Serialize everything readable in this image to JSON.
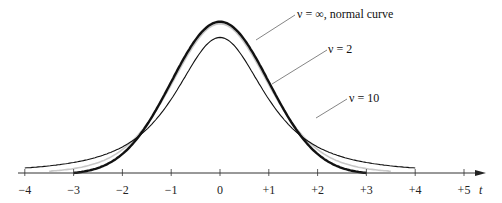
{
  "chart_data": {
    "type": "line",
    "title": "",
    "xlabel": "t",
    "ylabel": "",
    "xlim": [
      -4,
      5
    ],
    "grid": false,
    "legend": "annotations with leader lines",
    "x_ticks": [
      "−4",
      "−3",
      "−2",
      "−1",
      "0",
      "+1",
      "+2",
      "+3",
      "+4",
      "+5"
    ],
    "x_tick_values": [
      -4,
      -3,
      -2,
      -1,
      0,
      1,
      2,
      3,
      4,
      5
    ],
    "series": [
      {
        "name": "ν = ∞, normal curve",
        "distribution": "standard normal",
        "df": "infinity",
        "x_range": [
          -3,
          3
        ],
        "peak": 0.399,
        "color": "#111111",
        "stroke_width": 2.4
      },
      {
        "name": "ν = 10",
        "distribution": "Student t",
        "df": 10,
        "x_range": [
          -3.5,
          3.5
        ],
        "peak": 0.389,
        "color": "#c8c8c8",
        "stroke_width": 1.6
      },
      {
        "name": "ν = 2",
        "distribution": "Student t",
        "df": 2,
        "x_range": [
          -4,
          4
        ],
        "peak": 0.354,
        "color": "#111111",
        "stroke_width": 1.1
      }
    ],
    "annotations": [
      {
        "text": "ν = ∞,  normal curve",
        "target_series": "normal"
      },
      {
        "text": "ν = 2",
        "target_series": "t df=2"
      },
      {
        "text": "ν = 10",
        "target_series": "t df=10"
      }
    ]
  },
  "labels": {
    "normal": "ν = ∞,  normal curve",
    "nu2": "ν = 2",
    "nu10": "ν = 10",
    "axis_var": "t",
    "ticks": [
      "−4",
      "−3",
      "−2",
      "−1",
      "0",
      "+1",
      "+2",
      "+3",
      "+4",
      "+5"
    ]
  }
}
